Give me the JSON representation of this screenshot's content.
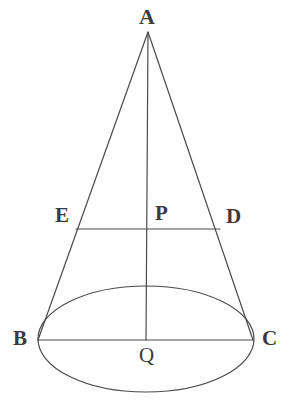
{
  "figure": {
    "type": "geometry-diagram",
    "background_color": "#ffffff",
    "stroke_color": "#4a4a4a",
    "label_color": "#3b3b3b",
    "stroke_width": 1.2,
    "canvas": {
      "width": 301,
      "height": 415
    },
    "points": {
      "A": {
        "label": "A",
        "x": 148,
        "y": 32,
        "role": "apex"
      },
      "E": {
        "label": "E",
        "x": 76,
        "y": 229,
        "role": "cross-section-left"
      },
      "P": {
        "label": "P",
        "x": 148,
        "y": 229,
        "role": "cross-section-center"
      },
      "D": {
        "label": "D",
        "x": 220,
        "y": 229,
        "role": "cross-section-right"
      },
      "B": {
        "label": "B",
        "x": 38,
        "y": 340,
        "role": "base-left"
      },
      "Q": {
        "label": "Q",
        "x": 146,
        "y": 340,
        "role": "base-center"
      },
      "C": {
        "label": "C",
        "x": 253,
        "y": 340,
        "role": "base-right"
      }
    },
    "base_ellipse": {
      "cx": 146,
      "cy": 339,
      "rx": 108,
      "ry": 53
    },
    "segments": [
      {
        "name": "slant-left-AB",
        "from": "A",
        "to": "B"
      },
      {
        "name": "slant-right-AC",
        "from": "A",
        "to": "C"
      },
      {
        "name": "axis-AQ",
        "from": "A",
        "to": "Q"
      },
      {
        "name": "cross-section-ED",
        "from": "E",
        "to": "D"
      },
      {
        "name": "base-diameter-BC",
        "from": "B",
        "to": "C"
      }
    ]
  }
}
